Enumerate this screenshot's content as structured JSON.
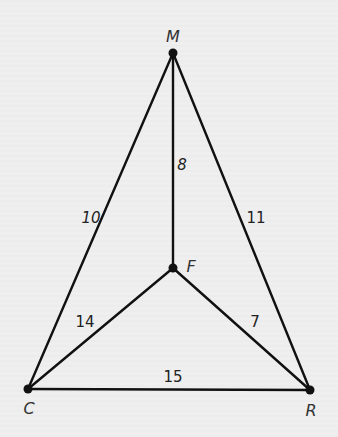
{
  "diagram": {
    "type": "graph",
    "colors": {
      "background": "#efefef",
      "line": "#111111",
      "text": "#222222"
    },
    "vertices": [
      {
        "id": "M",
        "label": "M",
        "x": 173,
        "y": 53,
        "label_x": 173,
        "label_y": 37
      },
      {
        "id": "F",
        "label": "F",
        "x": 173,
        "y": 268,
        "label_x": 191,
        "label_y": 267
      },
      {
        "id": "C",
        "label": "C",
        "x": 28,
        "y": 389,
        "label_x": 29,
        "label_y": 409
      },
      {
        "id": "R",
        "label": "R",
        "x": 310,
        "y": 390,
        "label_x": 311,
        "label_y": 411
      }
    ],
    "edges": [
      {
        "from": "M",
        "to": "C",
        "weight": "10",
        "label_x": 91,
        "label_y": 218
      },
      {
        "from": "M",
        "to": "R",
        "weight": "11",
        "label_x": 256,
        "label_y": 218
      },
      {
        "from": "M",
        "to": "F",
        "weight": "8",
        "label_x": 182,
        "label_y": 165
      },
      {
        "from": "F",
        "to": "C",
        "weight": "14",
        "label_x": 85,
        "label_y": 322
      },
      {
        "from": "F",
        "to": "R",
        "weight": "7",
        "label_x": 255,
        "label_y": 322
      },
      {
        "from": "C",
        "to": "R",
        "weight": "15",
        "label_x": 173,
        "label_y": 377
      }
    ]
  }
}
